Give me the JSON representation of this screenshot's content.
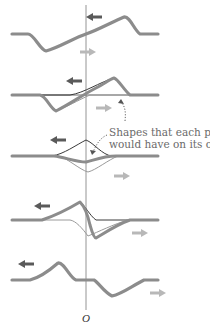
{
  "figure": {
    "origin_label": "O",
    "annotation": {
      "line1": "Shapes that each pulse",
      "line2": "would have on its own"
    },
    "colors": {
      "combined_pulse": "#8c8c8c",
      "left_moving_pulse": "#3a3a3a",
      "right_moving_pulse": "#9a9a9a",
      "left_arrow": "#606060",
      "right_arrow": "#b4b4b4",
      "axis": "#7a7a7a"
    },
    "frames": [
      {
        "index": 1,
        "name": "frame-1-before-overlap"
      },
      {
        "index": 2,
        "name": "frame-2-partial-overlap"
      },
      {
        "index": 3,
        "name": "frame-3-full-overlap"
      },
      {
        "index": 4,
        "name": "frame-4-partial-overlap"
      },
      {
        "index": 5,
        "name": "frame-5-after-overlap"
      }
    ]
  }
}
